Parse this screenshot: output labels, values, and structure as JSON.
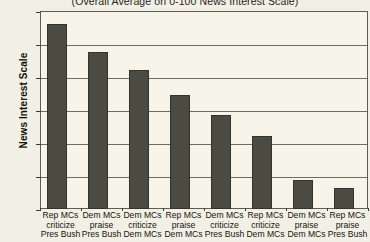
{
  "chart_data": {
    "type": "bar",
    "title": "",
    "subtitle": "(Overall Average on 0-100 News Interest Scale)",
    "xlabel": "",
    "ylabel": "News Interest Scale",
    "ylim": [
      30,
      60
    ],
    "yticks": [
      60,
      55,
      50,
      45,
      40,
      35,
      30
    ],
    "grid": true,
    "legend": "none",
    "bar_color": "#4b4b42",
    "plot_background": "#f7f5e9",
    "page_background": "#f2f0e4",
    "categories": [
      "Rep MCs criticize Pres Bush",
      "Dem MCs praise Pres Bush",
      "Dem MCs criticize Dem MCs",
      "Rep MCs praise Dem MCs",
      "Dem MCs criticize Pres Bush",
      "Rep MCs criticize Dem MCs",
      "Dem MCs praise Dem MCs",
      "Rep MCs praise Pres Bush"
    ],
    "category_lines": [
      [
        "Rep MCs",
        "criticize",
        "Pres Bush"
      ],
      [
        "Dem MCs",
        "praise",
        "Pres Bush"
      ],
      [
        "Dem MCs",
        "criticize",
        "Dem MCs"
      ],
      [
        "Rep MCs",
        "praise",
        "Dem MCs"
      ],
      [
        "Dem MCs",
        "criticize",
        "Pres Bush"
      ],
      [
        "Rep MCs",
        "criticize",
        "Dem MCs"
      ],
      [
        "Dem MCs",
        "praise",
        "Dem MCs"
      ],
      [
        "Rep MCs",
        "praise",
        "Pres Bush"
      ]
    ],
    "values": [
      58.0,
      53.8,
      51.0,
      47.3,
      44.3,
      41.0,
      34.4,
      33.2
    ]
  }
}
